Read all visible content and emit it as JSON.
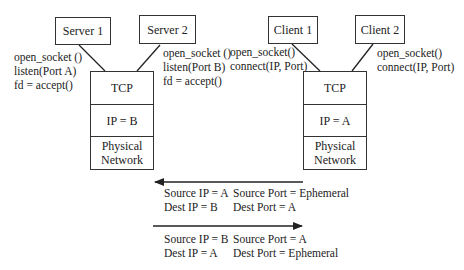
{
  "server_side": {
    "apps": [
      {
        "label": "Server 1",
        "calls": [
          "open_socket ()",
          "listen(Port A)",
          "fd = accept()"
        ]
      },
      {
        "label": "Server 2",
        "calls": [
          "open_socket ()",
          "listen(Port B)",
          "fd = accept()"
        ]
      }
    ],
    "stack": {
      "tcp": "TCP",
      "ip": "IP = B",
      "physical": [
        "Physical",
        "Network"
      ]
    }
  },
  "client_side": {
    "apps": [
      {
        "label": "Client 1",
        "calls": [
          "open_socket()",
          "connect(IP, Port)"
        ]
      },
      {
        "label": "Client 2",
        "calls": [
          "open_socket()",
          "connect(IP, Port)"
        ]
      }
    ],
    "stack": {
      "tcp": "TCP",
      "ip": "IP = A",
      "physical": [
        "Physical",
        "Network"
      ]
    }
  },
  "packets": [
    {
      "direction": "left",
      "lines": [
        [
          "Source IP = A",
          "Source Port = Ephemeral"
        ],
        [
          "Dest IP = B",
          "Dest Port = A"
        ]
      ]
    },
    {
      "direction": "right",
      "lines": [
        [
          "Source IP = B",
          "Source Port = A"
        ],
        [
          "Dest IP = A",
          "Dest Port = Ephemeral"
        ]
      ]
    }
  ]
}
